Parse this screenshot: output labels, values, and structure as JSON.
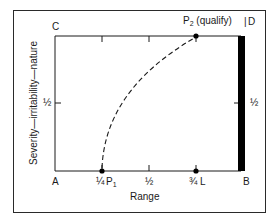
{
  "diagram": {
    "corners": {
      "top_left": "C",
      "top_right": "D",
      "bottom_left": "A",
      "bottom_right": "B"
    },
    "x_axis": {
      "label": "Range",
      "ticks": [
        "¼",
        "½",
        "¾"
      ]
    },
    "y_axis": {
      "label": "Severity—irritability—nature",
      "tick_left": "½",
      "tick_right": "½"
    },
    "points": {
      "p1": {
        "name": "P",
        "sub": "1"
      },
      "p2": {
        "name": "P",
        "sub": "2",
        "note": "(qualify)"
      },
      "l": {
        "name": "L"
      }
    },
    "colors": {
      "line": "#1a1a1a",
      "bar": "#000000",
      "background": "#ffffff"
    }
  }
}
